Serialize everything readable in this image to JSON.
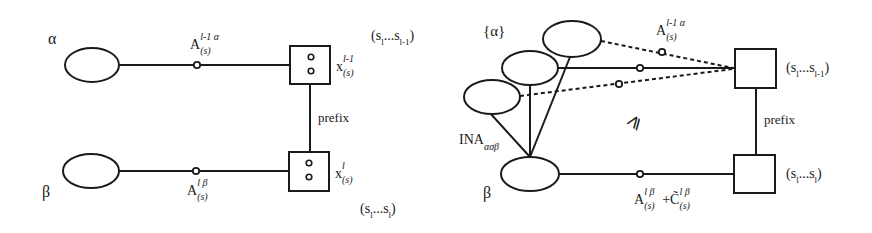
{
  "left_diagram": {
    "node_alpha": {
      "label": "α"
    },
    "node_beta": {
      "label": "β"
    },
    "edge_top": {
      "base": "A",
      "sup": "l-1  α",
      "sub": "(s)"
    },
    "edge_bottom": {
      "base": "A",
      "sup": "l β",
      "sub": "(s)"
    },
    "box_top": {
      "base": "x",
      "sup": "l-1",
      "sub": "(s)",
      "seq": "(s",
      "seq_sub1": "l",
      "seq_mid": "...s",
      "seq_sub2": "l-1",
      "seq_end": ")"
    },
    "box_bottom": {
      "base": "x",
      "sup": "l",
      "sub": "(s)",
      "seq": "(s",
      "seq_sub1": "l",
      "seq_mid": "...s",
      "seq_sub2": "l",
      "seq_end": ")"
    },
    "prefix_label": "prefix"
  },
  "right_diagram": {
    "set_label": "{α}",
    "node_beta": {
      "label": "β"
    },
    "ina_label": {
      "base": "INA",
      "sub": "ασβ"
    },
    "geq_symbol": "⩾",
    "edge_top": {
      "base": "A",
      "sup": "l-1  α",
      "sub": "(s)"
    },
    "edge_bottom": {
      "base": "A",
      "sup": "l β",
      "sub": "(s)",
      "plus": "+",
      "base2": "C̃",
      "sup2": "l β",
      "sub2": "(s)"
    },
    "box_top": {
      "seq": "(s",
      "seq_sub1": "l",
      "seq_mid": "...s",
      "seq_sub2": "l-1",
      "seq_end": ")"
    },
    "box_bottom": {
      "seq": "(s",
      "seq_sub1": "l",
      "seq_mid": "...s",
      "seq_sub2": "l",
      "seq_end": ")"
    },
    "prefix_label": "prefix"
  }
}
